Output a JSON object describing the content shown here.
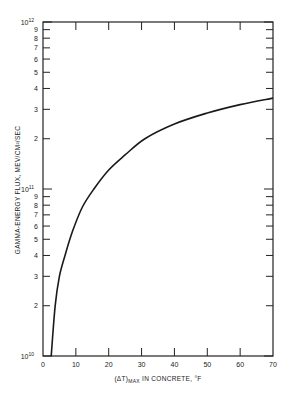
{
  "chart_data": {
    "type": "line",
    "title": "",
    "xlabel": "(ΔT)MAX IN CONCRETE, °F",
    "xlabel_main": "(ΔT)",
    "xlabel_sub": "MAX",
    "xlabel_rest": " IN CONCRETE, °F",
    "ylabel": "GAMMA-ENERGY FLUX, MEV/CM²/SEC",
    "xlim": [
      0,
      70
    ],
    "ylim": [
      10000000000.0,
      1000000000000.0
    ],
    "yscale": "log",
    "grid": false,
    "x_ticks": [
      0,
      10,
      20,
      30,
      40,
      50,
      60,
      70
    ],
    "y_tick_labels": [
      {
        "value": 10000000000.0,
        "label": "10",
        "exp": "10"
      },
      {
        "value": 20000000000.0,
        "label": "2"
      },
      {
        "value": 30000000000.0,
        "label": "3"
      },
      {
        "value": 40000000000.0,
        "label": "4"
      },
      {
        "value": 50000000000.0,
        "label": "5"
      },
      {
        "value": 60000000000.0,
        "label": "6"
      },
      {
        "value": 70000000000.0,
        "label": "7"
      },
      {
        "value": 80000000000.0,
        "label": "8"
      },
      {
        "value": 90000000000.0,
        "label": "9"
      },
      {
        "value": 100000000000.0,
        "label": "10",
        "exp": "11"
      },
      {
        "value": 200000000000.0,
        "label": "2"
      },
      {
        "value": 300000000000.0,
        "label": "3"
      },
      {
        "value": 400000000000.0,
        "label": "4"
      },
      {
        "value": 500000000000.0,
        "label": "5"
      },
      {
        "value": 600000000000.0,
        "label": "6"
      },
      {
        "value": 700000000000.0,
        "label": "7"
      },
      {
        "value": 800000000000.0,
        "label": "8"
      },
      {
        "value": 900000000000.0,
        "label": "9"
      },
      {
        "value": 1000000000000.0,
        "label": "10",
        "exp": "12"
      }
    ],
    "series": [
      {
        "name": "Gamma-energy flux vs max temperature rise",
        "x": [
          2.5,
          3.7,
          5.0,
          6.7,
          9.0,
          12.0,
          15.5,
          20.0,
          25.0,
          31.0,
          40.0,
          50.0,
          60.0,
          70.0
        ],
        "y": [
          10000000000.0,
          20000000000.0,
          30000000000.0,
          40000000000.0,
          56000000000.0,
          78000000000.0,
          100000000000.0,
          130000000000.0,
          160000000000.0,
          200000000000.0,
          245000000000.0,
          285000000000.0,
          320000000000.0,
          350000000000.0
        ]
      }
    ]
  }
}
